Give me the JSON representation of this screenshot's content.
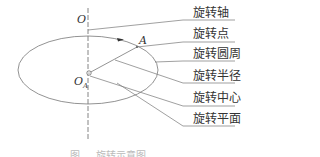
{
  "diagram": {
    "points": {
      "O": "O",
      "OA_main": "O",
      "OA_sub": "A",
      "A": "A"
    },
    "labels": [
      {
        "text": "旋转轴",
        "meaning": "rotation-axis"
      },
      {
        "text": "旋转点",
        "meaning": "rotation-point"
      },
      {
        "text": "旋转圆周",
        "meaning": "rotation-circumference"
      },
      {
        "text": "旋转半径",
        "meaning": "rotation-radius"
      },
      {
        "text": "旋转中心",
        "meaning": "rotation-center"
      },
      {
        "text": "旋转平面",
        "meaning": "rotation-plane"
      }
    ],
    "caption": "图 … 旋转示意图",
    "line_color": "#555555"
  }
}
